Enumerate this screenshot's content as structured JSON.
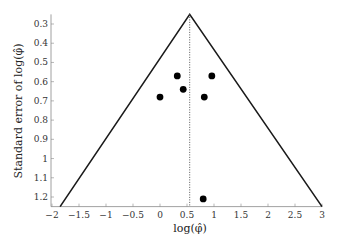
{
  "chart_data": {
    "type": "scatter",
    "subtype": "funnel-plot",
    "title": "",
    "xlabel": "log(φ̂)",
    "ylabel": "Standard error of log(φ̂)",
    "xlim": [
      -2,
      3
    ],
    "ylim": [
      1.25,
      0.25
    ],
    "y_inverted": true,
    "grid": false,
    "legend": null,
    "x_ticks": [
      "-2",
      "-1.5",
      "-1",
      "-0.5",
      "0",
      "0.5",
      "1",
      "1.5",
      "2",
      "2.5",
      "3"
    ],
    "y_ticks": [
      "0.3",
      "0.4",
      "0.5",
      "0.6",
      "0.7",
      "0.8",
      "0.9",
      "1",
      "1.1",
      "1.2"
    ],
    "points": [
      {
        "x": 0.0,
        "y": 0.68
      },
      {
        "x": 0.32,
        "y": 0.57
      },
      {
        "x": 0.43,
        "y": 0.64
      },
      {
        "x": 0.82,
        "y": 0.68
      },
      {
        "x": 0.96,
        "y": 0.57
      },
      {
        "x": 0.8,
        "y": 1.21
      }
    ],
    "funnel": {
      "apex": {
        "x": 0.55,
        "y": 0.25
      },
      "left_base": {
        "x": -1.85,
        "y": 1.25
      },
      "right_base": {
        "x": 3.0,
        "y": 1.25
      }
    },
    "reference_line": {
      "x": 0.55,
      "style": "dotted"
    }
  }
}
